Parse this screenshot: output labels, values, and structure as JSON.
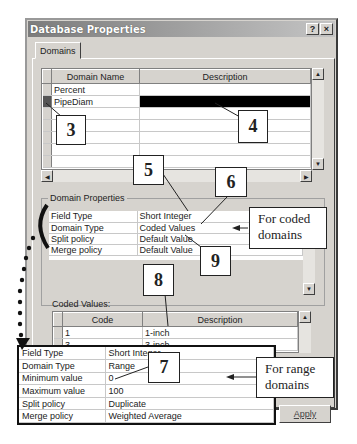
{
  "window": {
    "title": "Database Properties",
    "help_label": "?",
    "close_label": "×"
  },
  "tabs": [
    {
      "label": "Domains",
      "active": true
    }
  ],
  "domains_grid": {
    "columns": [
      "Domain Name",
      "Description"
    ],
    "rows": [
      {
        "name": "Percent",
        "description": ""
      },
      {
        "name": "PipeDiam",
        "description": "",
        "selected": true
      },
      {
        "name": "",
        "description": ""
      },
      {
        "name": "",
        "description": ""
      },
      {
        "name": "",
        "description": ""
      },
      {
        "name": "",
        "description": ""
      },
      {
        "name": "",
        "description": ""
      }
    ]
  },
  "domain_properties": {
    "label": "Domain Properties",
    "rows": [
      {
        "field": "Field Type",
        "value": "Short Integer"
      },
      {
        "field": "Domain Type",
        "value": "Coded Values"
      },
      {
        "field": "Split policy",
        "value": "Default Value"
      },
      {
        "field": "Merge policy",
        "value": "Default Value"
      }
    ]
  },
  "coded_values": {
    "label": "Coded Values:",
    "columns": [
      "Code",
      "Description"
    ],
    "rows": [
      {
        "code": "1",
        "description": "1-inch"
      },
      {
        "code": "3",
        "description": "3-inch"
      }
    ]
  },
  "range_properties": {
    "rows": [
      {
        "field": "Field Type",
        "value": "Short Integer"
      },
      {
        "field": "Domain Type",
        "value": "Range"
      },
      {
        "field": "Minimum value",
        "value": "0"
      },
      {
        "field": "Maximum value",
        "value": "100"
      },
      {
        "field": "Split policy",
        "value": "Duplicate"
      },
      {
        "field": "Merge policy",
        "value": "Weighted Average"
      }
    ]
  },
  "buttons": {
    "apply": "Apply"
  },
  "annotations": {
    "callouts": [
      "3",
      "4",
      "5",
      "6",
      "7",
      "8",
      "9"
    ],
    "coded_note": "For coded domains",
    "range_note": "For range domains"
  }
}
